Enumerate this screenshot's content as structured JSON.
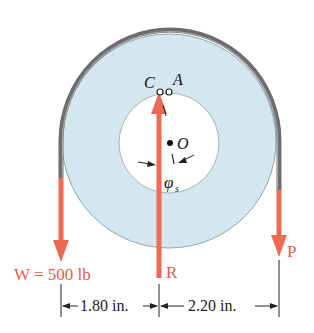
{
  "figure": {
    "labels": {
      "point_c": "C",
      "point_a": "A",
      "center_o": "O",
      "angle_phi": "φ",
      "angle_sub": "s",
      "weight": "W = 500 lb",
      "force_r": "R",
      "force_p": "P",
      "dim_left": "1.80 in.",
      "dim_right": "2.20 in."
    },
    "colors": {
      "force_arrow": "#ee6a55",
      "force_label": "#e0604c",
      "disc_fill": "#d4e6ee",
      "disc_edge": "#8aa8b8",
      "belt": "#6d6d6d",
      "hole_fill": "#ffffff",
      "dim_line": "#222222"
    }
  }
}
